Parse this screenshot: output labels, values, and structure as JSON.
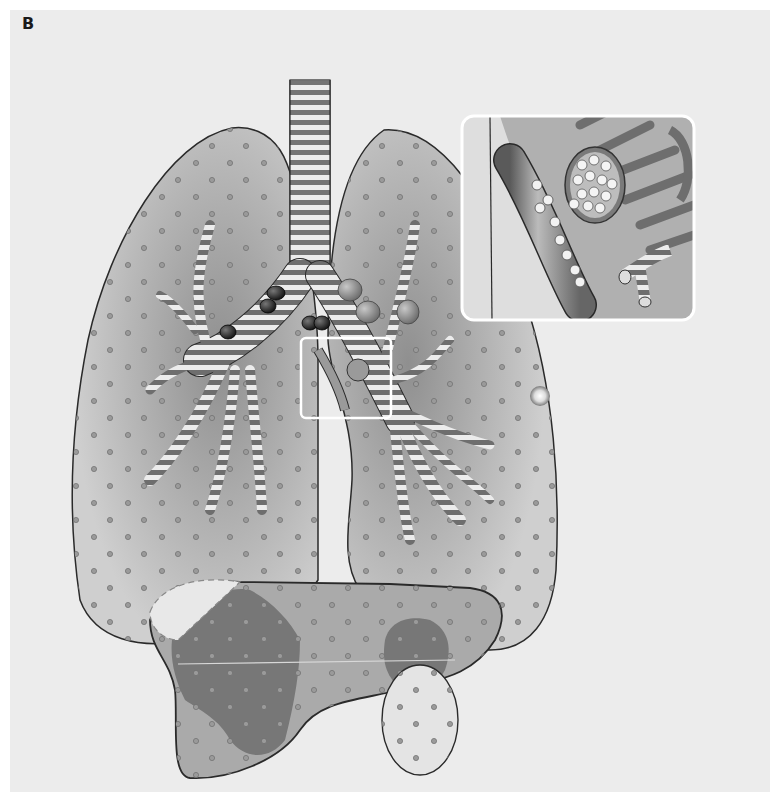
{
  "figure": {
    "panel_label": "B",
    "colors": {
      "background": "#ececec",
      "lung_fill": "#b9b9b9",
      "lung_outline": "#2a2a2a",
      "bronchus_stripe": "#6e6e6e",
      "bronchus_light": "#e8e8e8",
      "lymph_node_dark": "#1c1c1c",
      "lymph_node_gray": "#8a8a8a",
      "liver_fill": "#a9a9a9",
      "liver_lesion": "#727272",
      "inset_border": "#ffffff",
      "nodule": "#e6e6e6"
    },
    "elements": {
      "trachea": "trachea",
      "left_lung": "left-lung",
      "right_lung": "right-lung",
      "inset": "inset-magnification",
      "liver": "liver",
      "nodule": "pulmonary-nodule",
      "lymph_nodes": "hilar-lymph-nodes"
    }
  }
}
